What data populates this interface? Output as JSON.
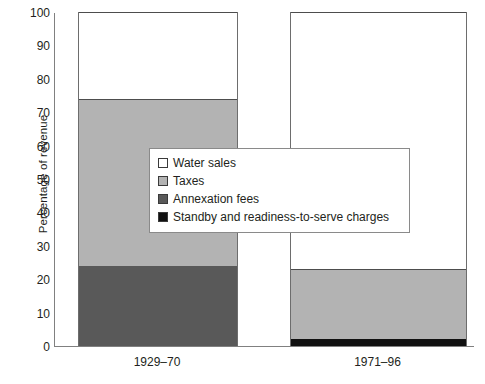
{
  "chart_data": {
    "type": "bar",
    "subtype": "stacked-bar-100",
    "title": "",
    "subtitle": "",
    "xlabel": "",
    "ylabel": "Percentage of revenue",
    "categories": [
      "1929–70",
      "1971–96"
    ],
    "ylim": [
      0,
      100
    ],
    "yticks": [
      0,
      10,
      20,
      30,
      40,
      50,
      60,
      70,
      80,
      90,
      100
    ],
    "ytick_labels": [
      "0",
      "10",
      "20",
      "30",
      "40",
      "50",
      "60",
      "70",
      "80",
      "90",
      "100"
    ],
    "grid": false,
    "legend_position": "center",
    "series": [
      {
        "name": "Water sales",
        "color": "#ffffff",
        "values": [
          26,
          77
        ]
      },
      {
        "name": "Taxes",
        "color": "#b3b3b3",
        "values": [
          50,
          21
        ]
      },
      {
        "name": "Annexation fees",
        "color": "#595959",
        "values": [
          24,
          0
        ]
      },
      {
        "name": "Standby and readiness-to-serve charges",
        "color": "#111111",
        "values": [
          0,
          2
        ]
      }
    ],
    "stack_boundaries": {
      "1929–70": [
        0,
        24,
        24,
        74,
        100
      ],
      "1971–96": [
        0,
        2,
        2,
        23,
        100
      ]
    },
    "annotations": []
  },
  "legend": {
    "items": [
      {
        "label": "Water sales",
        "color": "#ffffff"
      },
      {
        "label": "Taxes",
        "color": "#b3b3b3"
      },
      {
        "label": "Annexation fees",
        "color": "#595959"
      },
      {
        "label": "Standby and readiness-to-serve charges",
        "color": "#111111"
      }
    ]
  },
  "axis": {
    "y_title": "Percentage of revenue",
    "line_color": "#808080"
  }
}
